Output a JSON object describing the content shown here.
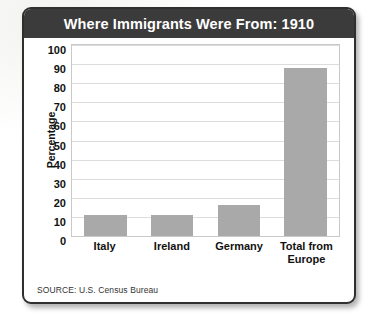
{
  "card": {
    "title": "Where Immigrants Were From: 1910",
    "source": "SOURCE: U.S. Census Bureau",
    "colors": {
      "title_bar": "#3b3b3b",
      "title_text": "#ffffff",
      "bar": "#a9a9a9",
      "gridline": "#dcdcdc",
      "plot_border": "#c9c9c9",
      "card_border": "#2f2f2f"
    }
  },
  "chart_data": {
    "type": "bar",
    "title": "Where Immigrants Were From: 1910",
    "xlabel": "",
    "ylabel": "Percentage",
    "categories": [
      "Italy",
      "Ireland",
      "Germany",
      "Total from\nEurope"
    ],
    "values": [
      11,
      11,
      16,
      88
    ],
    "ylim": [
      0,
      100
    ],
    "yticks": [
      100,
      90,
      80,
      70,
      60,
      50,
      40,
      30,
      20,
      10,
      0
    ],
    "grid": true,
    "legend": null,
    "series": [
      {
        "name": "Percentage of immigrants",
        "values": [
          11,
          11,
          16,
          88
        ]
      }
    ],
    "annotations": [
      "SOURCE: U.S. Census Bureau"
    ]
  }
}
